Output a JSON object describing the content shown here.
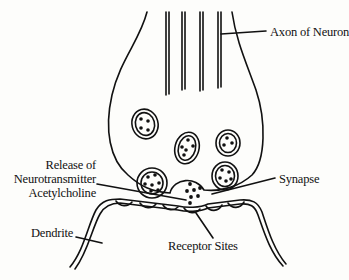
{
  "diagram": {
    "type": "neuron-synapse-illustration",
    "labels": {
      "axon": "Axon of Neuron",
      "release_line1": "Release of",
      "release_line2": "Neurotransmitter",
      "release_line3": "Acetylcholine",
      "synapse": "Synapse",
      "dendrite": "Dendrite",
      "receptor_sites": "Receptor Sites"
    },
    "colors": {
      "line": "#111111",
      "background": "#fdfdfb"
    }
  }
}
